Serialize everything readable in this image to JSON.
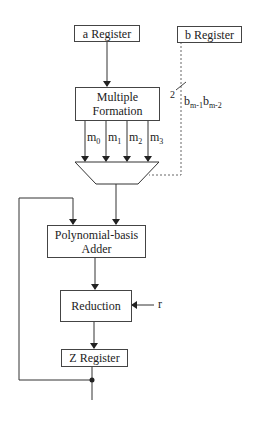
{
  "diagram": {
    "blocks": {
      "a_register": "a Register",
      "b_register": "b Register",
      "multiple_formation_line1": "Multiple",
      "multiple_formation_line2": "Formation",
      "adder_line1": "Polynomial-basis",
      "adder_line2": "Adder",
      "reduction": "Reduction",
      "z_register": "Z Register"
    },
    "signals": {
      "m0": {
        "base": "m",
        "sub": "0"
      },
      "m1": {
        "base": "m",
        "sub": "1"
      },
      "m2": {
        "base": "m",
        "sub": "2"
      },
      "m3": {
        "base": "m",
        "sub": "3"
      },
      "bus_width": "2",
      "b_select_1": {
        "base": "b",
        "sub": "m-1"
      },
      "b_select_2": {
        "base": "b",
        "sub": "m-2"
      },
      "reduction_input": "r"
    },
    "components": [
      "multiplexer (4-to-1)",
      "feedback loop from Z Register to adder"
    ]
  }
}
